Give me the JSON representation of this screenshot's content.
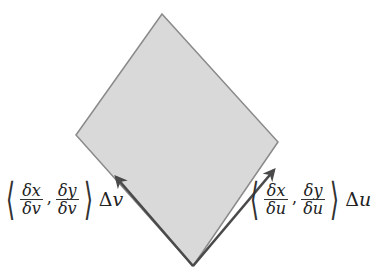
{
  "diagram": {
    "type": "parallelogram-tangent-vectors",
    "colors": {
      "fill": "#d9d9d9",
      "edge": "#8a8a8a",
      "vector": "#4a4a4a",
      "background": "#ffffff"
    },
    "shape": {
      "vertices": {
        "top": [
          162,
          14
        ],
        "right": [
          278,
          142
        ],
        "bottom": [
          193,
          266
        ],
        "left": [
          76,
          135
        ]
      }
    },
    "vectors": [
      {
        "name": "v-vector",
        "from": [
          193,
          266
        ],
        "to": [
          116,
          177
        ]
      },
      {
        "name": "u-vector",
        "from": [
          193,
          266
        ],
        "to": [
          274,
          170
        ]
      }
    ],
    "labels": {
      "left": {
        "open": "⟨",
        "frac1_num": "δx",
        "frac1_den": "δv",
        "comma": ",",
        "frac2_num": "δy",
        "frac2_den": "δv",
        "close": "⟩",
        "delta": "Δ",
        "var": "v"
      },
      "right": {
        "open": "⟨",
        "frac1_num": "δx",
        "frac1_den": "δu",
        "comma": ",",
        "frac2_num": "δy",
        "frac2_den": "δu",
        "close": "⟩",
        "delta": "Δ",
        "var": "u"
      }
    }
  }
}
